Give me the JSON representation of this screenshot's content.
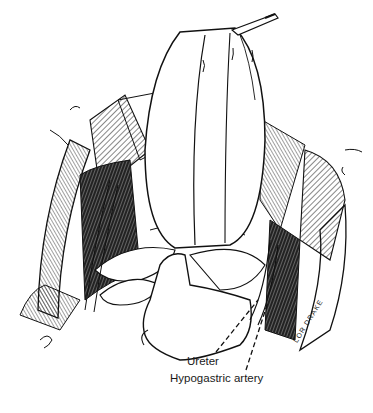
{
  "figure": {
    "labels": {
      "ureter": "Ureter",
      "hypogastric_artery": "Hypogastric artery"
    },
    "signature": "LOR DRAKE",
    "colors": {
      "ink": "#111111",
      "paper": "#ffffff"
    }
  }
}
